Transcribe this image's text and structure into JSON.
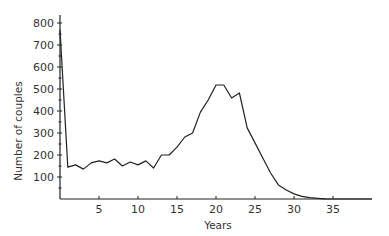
{
  "chart_data": {
    "type": "line",
    "title": "",
    "xlabel": "Years",
    "ylabel": "Number of couples",
    "xlim": [
      0,
      40
    ],
    "ylim": [
      0,
      850
    ],
    "grid": false,
    "legend": null,
    "x_ticks": [
      5,
      10,
      15,
      20,
      25,
      30,
      35
    ],
    "y_ticks": [
      100,
      200,
      300,
      400,
      500,
      600,
      700,
      800
    ],
    "x": [
      0,
      1,
      2,
      3,
      4,
      5,
      6,
      7,
      8,
      9,
      10,
      11,
      12,
      13,
      14,
      15,
      16,
      17,
      18,
      19,
      20,
      21,
      22,
      23,
      24,
      25,
      26,
      27,
      28,
      29,
      30,
      31,
      32,
      33,
      34,
      35,
      40
    ],
    "series": [
      {
        "name": "Number of couples",
        "values": [
          770,
          145,
          155,
          136,
          164,
          173,
          164,
          182,
          150,
          168,
          155,
          173,
          141,
          200,
          200,
          236,
          282,
          300,
          395,
          450,
          518,
          518,
          459,
          482,
          323,
          255,
          186,
          118,
          64,
          41,
          23,
          12,
          6,
          3,
          1,
          0,
          0
        ]
      }
    ]
  }
}
